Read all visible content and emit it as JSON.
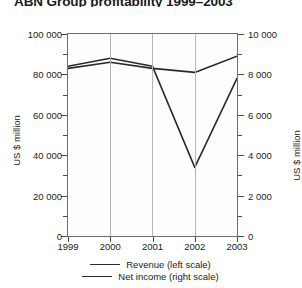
{
  "chart_data": {
    "type": "line",
    "title": "ABN Group profitability 1999–2003",
    "xlabel": "",
    "ylabel": "US $ million",
    "y2label": "US $ million",
    "categories": [
      "1999",
      "2000",
      "2001",
      "2002",
      "2003"
    ],
    "series": [
      {
        "name": "Revenue (left scale)",
        "axis": "left",
        "values": [
          83000,
          86000,
          83000,
          81000,
          89000
        ],
        "color": "#2a2a2a"
      },
      {
        "name": "Net income (right scale)",
        "axis": "right",
        "values": [
          8400,
          8800,
          8400,
          3400,
          7800
        ],
        "color": "#2a2a2a"
      }
    ],
    "ylim": [
      0,
      100000
    ],
    "y2lim": [
      0,
      10000
    ],
    "yticks": [
      "0",
      "20 000",
      "40 000",
      "60 000",
      "80 000",
      "100 000"
    ],
    "ytick_values": [
      0,
      20000,
      40000,
      60000,
      80000,
      100000
    ],
    "y2ticks": [
      "0",
      "2 000",
      "4 000",
      "6 000",
      "8 000",
      "10 000"
    ],
    "y2tick_values": [
      0,
      2000,
      4000,
      6000,
      8000,
      10000
    ],
    "grid": "vertical",
    "legend_position": "bottom"
  },
  "legend": {
    "entries": [
      {
        "label": "Revenue (left scale)"
      },
      {
        "label": "Net income (right scale)"
      }
    ]
  },
  "axes": {
    "left_title": "US $ million",
    "right_title": "US $ million"
  }
}
